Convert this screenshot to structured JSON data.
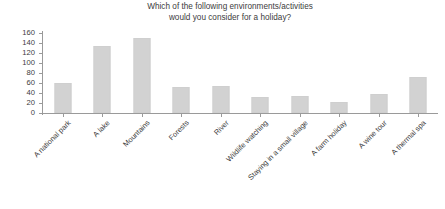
{
  "chart_data": {
    "type": "bar",
    "title": "Which of the following environments/activities would you consider for a holiday?",
    "title_lines": [
      "Which of the following environments/activities",
      "would you consider for a holiday?"
    ],
    "xlabel": "",
    "ylabel": "",
    "ylim": [
      0,
      160
    ],
    "ytick_step": 20,
    "yticks": [
      160,
      140,
      120,
      100,
      80,
      60,
      40,
      20,
      0
    ],
    "ytick_labels": [
      "160",
      "140",
      "120",
      "100",
      "80",
      "60",
      "40",
      "20",
      "0"
    ],
    "grid": false,
    "legend": null,
    "bar_color": "#d2d2d2",
    "axis_color": "#9a9a9a",
    "text_color": "#3c3c3c",
    "categories": [
      "A national park",
      "A lake",
      "Mountains",
      "Forests",
      "River",
      "Wildlife watching",
      "Staying in a small village",
      "A farm holiday",
      "A wine tour",
      "A thermal spa"
    ],
    "values": [
      61,
      135,
      150,
      52,
      55,
      33,
      35,
      22,
      39,
      72
    ]
  }
}
